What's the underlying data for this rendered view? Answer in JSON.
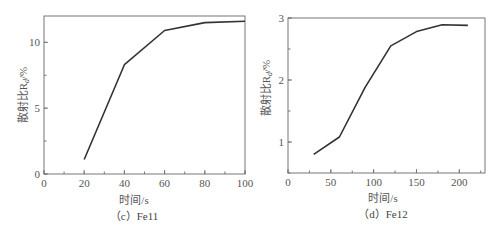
{
  "chart_data": [
    {
      "type": "line",
      "panel": "(c) Fe11",
      "caption": "（c）Fe11",
      "xlabel": "时间/s",
      "ylabel": "散射比R_d/%",
      "x": [
        20,
        40,
        60,
        80,
        100
      ],
      "values": [
        1.1,
        8.3,
        10.9,
        11.5,
        11.6
      ],
      "xlim": [
        0,
        100
      ],
      "ylim": [
        0,
        12
      ],
      "xticks": [
        0,
        20,
        40,
        60,
        80,
        100
      ],
      "yticks": [
        0,
        5,
        10
      ],
      "grid": false,
      "legend": null
    },
    {
      "type": "line",
      "panel": "(d) Fe12",
      "caption": "（d）Fe12",
      "xlabel": "时间/s",
      "ylabel": "散射比R_d/%",
      "x": [
        30,
        60,
        90,
        120,
        150,
        180,
        210
      ],
      "values": [
        0.8,
        1.08,
        1.88,
        2.55,
        2.78,
        2.89,
        2.88
      ],
      "xlim": [
        0,
        230
      ],
      "ylim": [
        0.5,
        3
      ],
      "xticks": [
        0,
        50,
        100,
        150,
        200
      ],
      "yticks": [
        1,
        2,
        3
      ],
      "grid": false,
      "legend": null
    }
  ],
  "labels": {
    "left": {
      "xlabel": "时间/s",
      "ylabel": "散射比R",
      "ylabel_sub": "d",
      "ylabel_unit": "/%",
      "caption": "（c）Fe11",
      "xticks": [
        "0",
        "20",
        "40",
        "60",
        "80",
        "100"
      ],
      "yticks": [
        "0",
        "5",
        "10"
      ]
    },
    "right": {
      "xlabel": "时间/s",
      "ylabel": "散射比R",
      "ylabel_sub": "d",
      "ylabel_unit": "/%",
      "caption": "（d）Fe12",
      "xticks": [
        "0",
        "50",
        "100",
        "150",
        "200"
      ],
      "yticks": [
        "1",
        "2",
        "3"
      ]
    }
  }
}
